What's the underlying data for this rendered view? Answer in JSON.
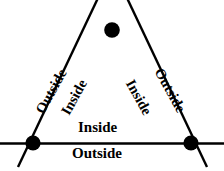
{
  "figure": {
    "background_color": "#ffffff",
    "stroke_color": "#000000",
    "width": 224,
    "height": 171
  },
  "labels": {
    "bottom_edge": {
      "above": "Inside",
      "below": "Outside"
    },
    "left_edge": {
      "outer": "Outside",
      "inner": "Inside"
    },
    "right_edge": {
      "outer": "Outside",
      "inner": "Inside"
    }
  },
  "geometry": {
    "vertices": [
      {
        "name": "apex",
        "x": 112,
        "y": 30
      },
      {
        "name": "bottom-left",
        "x": 33,
        "y": 143
      },
      {
        "name": "bottom-right",
        "x": 191,
        "y": 143
      }
    ],
    "dot_radius": 7.5,
    "line_width": 2.4,
    "edges": [
      {
        "name": "bottom-edge",
        "x1": 0,
        "y1": 143,
        "x2": 224,
        "y2": 143
      },
      {
        "name": "left-edge",
        "x1": 98,
        "y1": 0,
        "x2": 18,
        "y2": 166
      },
      {
        "name": "right-edge",
        "x1": 127,
        "y1": 0,
        "x2": 207,
        "y2": 166
      }
    ]
  }
}
